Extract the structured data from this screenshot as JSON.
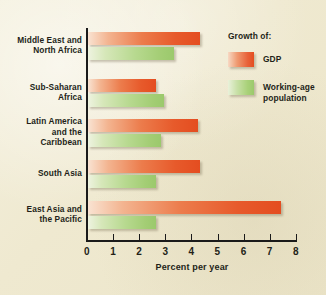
{
  "chart_data": {
    "type": "bar",
    "orientation": "horizontal",
    "title": "",
    "xlabel": "Percent per year",
    "ylabel": "",
    "xlim": [
      0,
      8
    ],
    "xticks": [
      "0",
      "1",
      "2",
      "3",
      "4",
      "5",
      "6",
      "7",
      "8"
    ],
    "grid": false,
    "legend_position": "top-right",
    "legend_title": "Growth of:",
    "categories": [
      "Middle East and North Africa",
      "Sub-Saharan Africa",
      "Latin America and the Caribbean",
      "South Asia",
      "East Asia and the Pacific"
    ],
    "category_lines": [
      [
        "Middle East and",
        "North Africa"
      ],
      [
        "Sub-Saharan",
        "Africa"
      ],
      [
        "Latin America",
        "and the",
        "Caribbean"
      ],
      [
        "South Asia"
      ],
      [
        "East Asia and",
        "the Pacific"
      ]
    ],
    "series": [
      {
        "name": "GDP",
        "color": "#e44d20",
        "values": [
          4.3,
          2.6,
          4.2,
          4.3,
          7.4
        ]
      },
      {
        "name": "Working-age population",
        "color": "#9bc96c",
        "values": [
          3.3,
          2.9,
          2.8,
          2.6,
          2.6
        ]
      }
    ]
  },
  "axis": {
    "x_title": "Percent per year",
    "ticks": [
      {
        "label": "0",
        "value": 0
      },
      {
        "label": "1",
        "value": 1
      },
      {
        "label": "2",
        "value": 2
      },
      {
        "label": "3",
        "value": 3
      },
      {
        "label": "4",
        "value": 4
      },
      {
        "label": "5",
        "value": 5
      },
      {
        "label": "6",
        "value": 6
      },
      {
        "label": "7",
        "value": 7
      },
      {
        "label": "8",
        "value": 8
      }
    ]
  },
  "legend": {
    "title": "Growth of:",
    "items": [
      {
        "label": "GDP",
        "series": "gdp"
      },
      {
        "label": "Working-age population",
        "series": "pop"
      }
    ]
  },
  "colors": {
    "background": "#efe9d2",
    "axis": "#1a1a1a",
    "text": "#231f18",
    "gdp": "#e44d20",
    "population": "#9bc96c"
  }
}
